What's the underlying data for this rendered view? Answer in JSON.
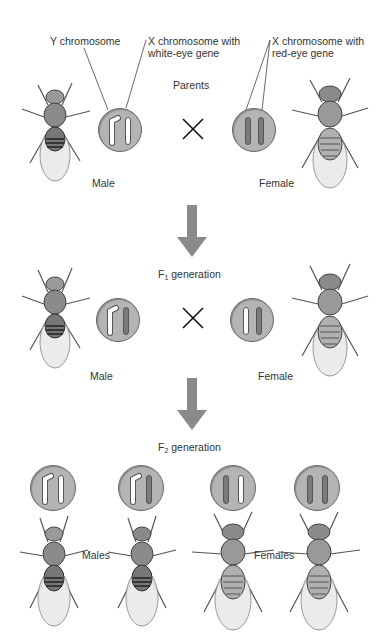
{
  "labels": {
    "y_chromosome": "Y chromosome",
    "x_white_line1": "X chromosome with",
    "x_white_line2": "white-eye gene",
    "x_red_line1": "X chromosome with",
    "x_red_line2": "red-eye gene",
    "parents": "Parents",
    "f1_prefix": "F",
    "f1_sub": "1",
    "f1_suffix": " generation",
    "f2_prefix": "F",
    "f2_sub": "2",
    "f2_suffix": " generation",
    "male": "Male",
    "female": "Female",
    "males": "Males",
    "females": "Females",
    "cross_symbol": "×"
  },
  "colors": {
    "circle_fill": "#b4b4b4",
    "red_eye_chromosome": "#7a7a7a",
    "white_eye_chromosome": "#ffffff",
    "arrow": "#8a8a8a"
  },
  "generations": [
    {
      "name": "Parents",
      "male": [
        "Y",
        "X-white"
      ],
      "female": [
        "X-red",
        "X-red"
      ]
    },
    {
      "name": "F1 generation",
      "male": [
        "Y",
        "X-red"
      ],
      "female": [
        "X-white",
        "X-red"
      ]
    },
    {
      "name": "F2 generation",
      "males": [
        [
          "Y",
          "X-white"
        ],
        [
          "Y",
          "X-red"
        ]
      ],
      "females": [
        [
          "X-red",
          "X-white"
        ],
        [
          "X-red",
          "X-red"
        ]
      ]
    }
  ]
}
